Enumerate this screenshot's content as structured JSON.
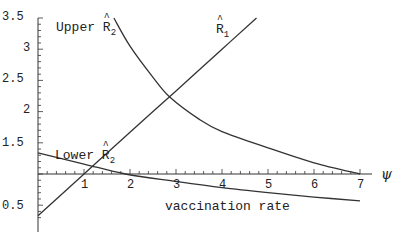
{
  "chart_data": {
    "type": "line",
    "title": "",
    "xlabel": "vaccination rate",
    "xsymbol": "ψ",
    "ylabel": "",
    "xlim": [
      0,
      7.2
    ],
    "ylim": [
      0.3,
      3.5
    ],
    "x_axis_crosses_y_at": 1,
    "grid": false,
    "x_ticks": [
      1,
      2,
      3,
      4,
      5,
      6,
      7
    ],
    "y_ticks": [
      0.5,
      1.5,
      2,
      2.5,
      3,
      3.5
    ],
    "y_tick_labels": [
      "0.5",
      "1.5",
      "2",
      "2.5",
      "3",
      "3.5"
    ],
    "series": [
      {
        "name": "R̂1",
        "label": "R̂",
        "subscript": "1",
        "x": [
          0,
          1,
          2,
          3,
          4,
          4.75
        ],
        "y": [
          0.33,
          1.0,
          1.67,
          2.33,
          3.0,
          3.5
        ]
      },
      {
        "name": "Upper R̂2",
        "label": "Upper R̂",
        "subscript": "2",
        "x": [
          1.65,
          2.0,
          2.5,
          2.87,
          3.5,
          4.0,
          5.0,
          6.0,
          7.0
        ],
        "y": [
          3.5,
          3.05,
          2.55,
          2.23,
          1.88,
          1.68,
          1.42,
          1.18,
          1.0
        ]
      },
      {
        "name": "Lower R̂2",
        "label": "Lower R̂",
        "subscript": "2",
        "x": [
          0,
          1,
          1.9,
          3,
          4,
          5,
          6,
          7
        ],
        "y": [
          1.34,
          1.16,
          1.0,
          0.88,
          0.78,
          0.7,
          0.63,
          0.57
        ]
      }
    ]
  },
  "labels": {
    "upper": "Upper R",
    "upper_sub": "2",
    "r1": "R",
    "r1_sub": "1",
    "lower": "Lower R",
    "lower_sub": "2",
    "xlabel": "vaccination rate",
    "xsymbol": "ψ"
  },
  "ticks": {
    "y": [
      "3.5",
      "3",
      "2.5",
      "2",
      "1.5",
      "0.5"
    ],
    "x": [
      "1",
      "2",
      "3",
      "4",
      "5",
      "6",
      "7"
    ]
  }
}
